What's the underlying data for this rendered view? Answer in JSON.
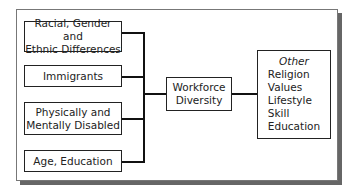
{
  "diagram": {
    "left_boxes": [
      {
        "label": [
          "Racial, Gender and",
          "Ethnic Differences"
        ]
      },
      {
        "label": [
          "Immigrants"
        ]
      },
      {
        "label": [
          "Physically and",
          "Mentally Disabled"
        ]
      },
      {
        "label": [
          "Age, Education"
        ]
      }
    ],
    "center": {
      "label": [
        "Workforce",
        "Diversity"
      ]
    },
    "right": {
      "heading": "Other",
      "items": [
        "Religion",
        "Values",
        "Lifestyle",
        "Skill",
        "Education"
      ]
    }
  }
}
